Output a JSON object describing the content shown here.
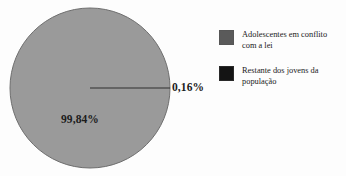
{
  "chart_data": {
    "type": "pie",
    "title": "",
    "subtitle": "",
    "xlabel": "",
    "ylabel": "",
    "categories": [
      "Adolescentes em conflito com a lei",
      "Restante dos jovens da população"
    ],
    "values": [
      0.16,
      99.84
    ],
    "value_labels": [
      "0,16%",
      "99,84%"
    ],
    "units": "percent",
    "colors": [
      "#5a5a5a",
      "#141414"
    ],
    "slice_colors": [
      "#1c1c1c",
      "#9a9a9a"
    ],
    "legend_position": "right",
    "grid": false,
    "start_angle_deg": 0,
    "direction": "clockwise"
  },
  "pie": {
    "background": "#fdfdfd",
    "fill_color": "#9a9a9a",
    "outline_color": "#6e6e6e",
    "sliver_color": "#2e2e2e",
    "center_x": 90,
    "center_y": 88,
    "radius": 80,
    "minor_label": "0,16%",
    "major_label": "99,84%"
  },
  "legend": {
    "items": [
      {
        "label": "Adolescentes em conflito com a lei",
        "color": "#5a5a5a",
        "swatch_name": "legend-swatch-adolescentes"
      },
      {
        "label": "Restante dos jovens da população",
        "color": "#141414",
        "swatch_name": "legend-swatch-restante"
      }
    ]
  }
}
